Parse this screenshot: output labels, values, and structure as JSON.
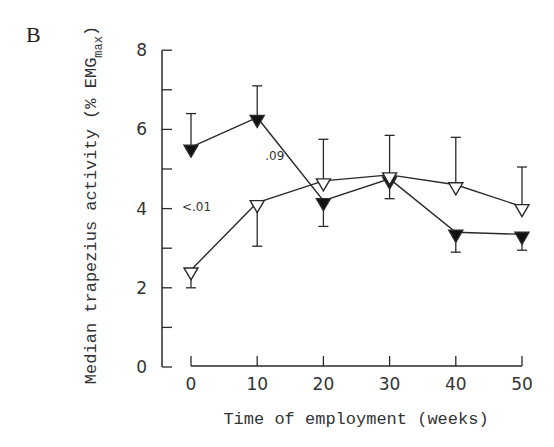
{
  "panel_label": "B",
  "chart_data": {
    "type": "line",
    "title": "",
    "xlabel": "Time of employment (weeks)",
    "ylabel": "Median trapezius activity (% EMG",
    "ylabel_subscript": "max",
    "ylabel_close": ")",
    "x": [
      0,
      10,
      20,
      30,
      40,
      50
    ],
    "x_ticks": [
      "0",
      "10",
      "20",
      "30",
      "40",
      "50"
    ],
    "y_ticks": [
      "0",
      "2",
      "4",
      "6",
      "8"
    ],
    "xlim": [
      0,
      50
    ],
    "ylim": [
      0,
      8
    ],
    "grid": false,
    "legend": "none",
    "series": [
      {
        "name": "filled-triangle",
        "marker": "filled-down-triangle",
        "values": [
          5.45,
          6.2,
          4.1,
          4.65,
          3.3,
          3.25
        ],
        "error_upper": [
          6.4,
          7.1,
          null,
          null,
          null,
          null
        ],
        "error_lower": [
          null,
          null,
          3.55,
          4.25,
          2.9,
          2.95
        ]
      },
      {
        "name": "open-triangle",
        "marker": "open-down-triangle",
        "values": [
          2.35,
          4.05,
          4.6,
          4.75,
          4.5,
          3.95
        ],
        "error_upper": [
          null,
          null,
          5.75,
          5.85,
          5.8,
          5.05
        ],
        "error_lower": [
          2.0,
          3.05,
          null,
          null,
          null,
          null
        ]
      }
    ],
    "annotations": [
      {
        "text": ".09",
        "x": 10,
        "y": 5.3
      },
      {
        "text": "<.01",
        "x": 0,
        "y": 4.0
      }
    ]
  }
}
